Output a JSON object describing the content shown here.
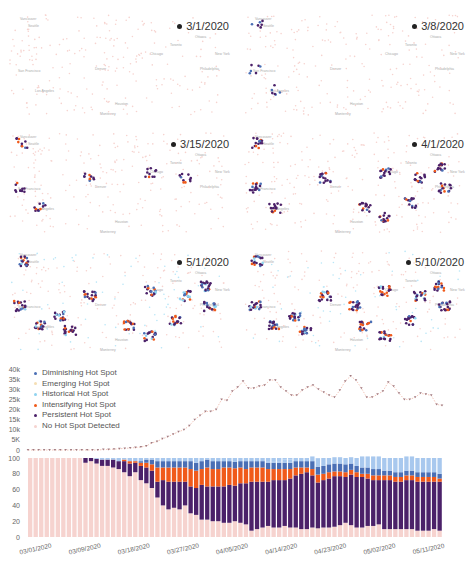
{
  "maps": [
    {
      "date": "3/1/2020"
    },
    {
      "date": "3/8/2020"
    },
    {
      "date": "3/15/2020"
    },
    {
      "date": "4/1/2020"
    },
    {
      "date": "5/1/2020"
    },
    {
      "date": "5/10/2020"
    }
  ],
  "legend": {
    "items": [
      {
        "label": "Diminishing Hot Spot",
        "color": "#4a6fb5"
      },
      {
        "label": "Emerging Hot Spot",
        "color": "#f5deb3"
      },
      {
        "label": "Historical Hot Spot",
        "color": "#8fd3f0"
      },
      {
        "label": "Intensifying Hot Spot",
        "color": "#f05a1a"
      },
      {
        "label": "Persistent Hot Spot",
        "color": "#4b2169"
      },
      {
        "label": "No Hot Spot Detected",
        "color": "#f6d3cf"
      }
    ]
  },
  "chart_data": [
    {
      "type": "line",
      "title": "",
      "xlabel": "",
      "ylabel": "",
      "ylim": [
        0,
        40000
      ],
      "yticks": [
        "0",
        "5K",
        "10k",
        "15k",
        "20k",
        "25k",
        "30k",
        "35k",
        "40k"
      ],
      "x_start": "03/01/2020",
      "x_end": "05/15/2020",
      "series": [
        {
          "name": "New cases",
          "values": [
            0,
            0,
            0,
            0,
            0,
            0,
            0,
            0,
            0,
            0,
            0,
            0,
            0,
            0,
            200,
            300,
            400,
            600,
            800,
            1000,
            1200,
            1500,
            2000,
            3500,
            4200,
            5500,
            6500,
            7800,
            9000,
            10000,
            12000,
            15000,
            17000,
            19000,
            19000,
            20000,
            25000,
            24500,
            29000,
            31000,
            34000,
            30500,
            30500,
            31500,
            32000,
            34500,
            34500,
            31000,
            29000,
            27000,
            27000,
            29500,
            31000,
            32000,
            30000,
            28500,
            27000,
            26000,
            29500,
            34000,
            36500,
            34500,
            30500,
            26000,
            26000,
            27500,
            29000,
            33500,
            31500,
            28000,
            25000,
            25000,
            26000,
            28000,
            27500,
            27000,
            22500,
            22000
          ]
        }
      ]
    },
    {
      "type": "bar",
      "stacked": true,
      "title": "",
      "xlabel": "",
      "ylabel": "",
      "ylim": [
        0,
        100
      ],
      "yticks": [
        "0",
        "20",
        "40",
        "60",
        "80",
        "100"
      ],
      "xtick_labels": [
        "03/01/2020",
        "03/09/2020",
        "03/18/2020",
        "03/27/2020",
        "04/05/2020",
        "04/14/2020",
        "04/23/2020",
        "05/02/2020",
        "05/11/2020"
      ],
      "categories_count": 75,
      "series": [
        {
          "name": "No Hot Spot Detected",
          "color": "#f6d3cf",
          "values": [
            100,
            100,
            100,
            100,
            100,
            100,
            100,
            100,
            100,
            100,
            94,
            96,
            93,
            90,
            90,
            88,
            86,
            82,
            77,
            82,
            72,
            68,
            62,
            50,
            40,
            35,
            37,
            35,
            40,
            30,
            28,
            22,
            22,
            20,
            20,
            18,
            18,
            20,
            18,
            16,
            8,
            10,
            12,
            14,
            12,
            12,
            14,
            12,
            12,
            10,
            10,
            12,
            11,
            12,
            12,
            13,
            15,
            18,
            15,
            12,
            12,
            14,
            14,
            16,
            10,
            10,
            10,
            10,
            10,
            10,
            8,
            8,
            8,
            10,
            8
          ]
        },
        {
          "name": "Persistent Hot Spot",
          "color": "#4b2169",
          "values": [
            0,
            0,
            0,
            0,
            0,
            0,
            0,
            0,
            0,
            0,
            6,
            4,
            6,
            8,
            8,
            10,
            10,
            14,
            16,
            12,
            18,
            20,
            22,
            20,
            32,
            35,
            33,
            35,
            30,
            34,
            34,
            44,
            42,
            44,
            44,
            46,
            48,
            45,
            50,
            52,
            62,
            60,
            58,
            56,
            60,
            60,
            58,
            62,
            66,
            70,
            72,
            66,
            58,
            60,
            62,
            64,
            62,
            58,
            64,
            64,
            64,
            60,
            58,
            56,
            62,
            62,
            60,
            60,
            62,
            62,
            62,
            62,
            62,
            60,
            62
          ]
        },
        {
          "name": "Intensifying Hot Spot",
          "color": "#f05a1a",
          "values": [
            0,
            0,
            0,
            0,
            0,
            0,
            0,
            0,
            0,
            0,
            0,
            0,
            0,
            0,
            0,
            0,
            0,
            2,
            3,
            2,
            4,
            6,
            8,
            18,
            16,
            18,
            18,
            18,
            18,
            22,
            22,
            20,
            24,
            22,
            22,
            24,
            22,
            22,
            20,
            18,
            18,
            18,
            18,
            16,
            14,
            14,
            14,
            12,
            10,
            8,
            6,
            8,
            10,
            8,
            8,
            6,
            6,
            6,
            6,
            6,
            4,
            6,
            6,
            6,
            6,
            6,
            6,
            6,
            6,
            6,
            6,
            6,
            6,
            6,
            4
          ]
        },
        {
          "name": "Diminishing Hot Spot",
          "color": "#4a6fb5",
          "values": [
            0,
            0,
            0,
            0,
            0,
            0,
            0,
            0,
            0,
            0,
            0,
            0,
            0,
            0,
            0,
            0,
            0,
            0,
            0,
            0,
            2,
            4,
            6,
            8,
            8,
            8,
            8,
            8,
            8,
            10,
            10,
            10,
            10,
            10,
            10,
            8,
            8,
            8,
            8,
            10,
            8,
            8,
            8,
            8,
            8,
            8,
            8,
            8,
            8,
            8,
            8,
            10,
            10,
            10,
            10,
            10,
            10,
            10,
            8,
            8,
            8,
            8,
            8,
            8,
            6,
            6,
            6,
            6,
            6,
            6,
            6,
            6,
            6,
            6,
            6
          ]
        },
        {
          "name": "Historical Hot Spot",
          "color": "#a8c8ee",
          "values": [
            0,
            0,
            0,
            0,
            0,
            0,
            0,
            0,
            0,
            0,
            0,
            0,
            0,
            0,
            0,
            0,
            0,
            0,
            0,
            0,
            0,
            0,
            0,
            0,
            0,
            0,
            0,
            0,
            0,
            0,
            0,
            0,
            0,
            0,
            0,
            0,
            0,
            0,
            0,
            0,
            0,
            0,
            0,
            2,
            2,
            2,
            4,
            4,
            4,
            4,
            4,
            6,
            10,
            10,
            8,
            8,
            8,
            8,
            8,
            10,
            14,
            14,
            16,
            16,
            16,
            16,
            18,
            18,
            18,
            18,
            18,
            18,
            18,
            18,
            20
          ]
        },
        {
          "name": "Emerging Hot Spot",
          "color": "#f5deb3",
          "values": [
            0,
            0,
            0,
            0,
            0,
            0,
            0,
            0,
            0,
            0,
            0,
            0,
            0,
            0,
            0,
            0,
            0,
            0,
            0,
            0,
            0,
            0,
            0,
            0,
            0,
            0,
            0,
            0,
            0,
            0,
            0,
            0,
            0,
            0,
            0,
            0,
            0,
            0,
            0,
            0,
            0,
            0,
            0,
            0,
            0,
            0,
            0,
            0,
            0,
            0,
            0,
            0,
            0,
            0,
            0,
            0,
            0,
            0,
            0,
            0,
            0,
            0,
            0,
            0,
            0,
            0,
            0,
            0,
            0,
            0,
            0,
            0,
            0,
            0,
            0
          ]
        }
      ]
    }
  ]
}
